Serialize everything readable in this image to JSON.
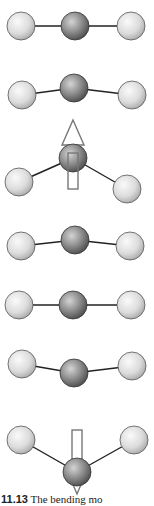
{
  "figure": {
    "number": "11.13",
    "caption_text": "The bending mo",
    "colors": {
      "outer_atom_light": "#f2f2f2",
      "outer_atom_dark": "#a8a8a8",
      "center_atom_light": "#c8c8c8",
      "center_atom_dark": "#555555",
      "bond": "#222222",
      "arrow_stroke": "#777777"
    },
    "atom_radius_outer": 14,
    "atom_radius_center": 14,
    "frames": [
      {
        "label": "frame-1",
        "left": [
          21,
          26
        ],
        "center": [
          75,
          26
        ],
        "right": [
          131,
          26
        ],
        "arrow": "none"
      },
      {
        "label": "frame-2",
        "left": [
          22,
          95
        ],
        "center": [
          74,
          88
        ],
        "right": [
          132,
          95
        ],
        "arrow": "none"
      },
      {
        "label": "frame-3",
        "left": [
          19,
          182
        ],
        "center": [
          73,
          158
        ],
        "right": [
          127,
          189
        ],
        "arrow": "up"
      },
      {
        "label": "frame-4",
        "left": [
          21,
          246
        ],
        "center": [
          75,
          240
        ],
        "right": [
          130,
          246
        ],
        "arrow": "none"
      },
      {
        "label": "frame-5",
        "left": [
          19,
          305
        ],
        "center": [
          73,
          305
        ],
        "right": [
          131,
          305
        ],
        "arrow": "none"
      },
      {
        "label": "frame-6",
        "left": [
          22,
          364
        ],
        "center": [
          74,
          373
        ],
        "right": [
          132,
          366
        ],
        "arrow": "none"
      },
      {
        "label": "frame-7",
        "left": [
          21,
          440
        ],
        "center": [
          77,
          472
        ],
        "right": [
          134,
          440
        ],
        "arrow": "down"
      }
    ]
  }
}
